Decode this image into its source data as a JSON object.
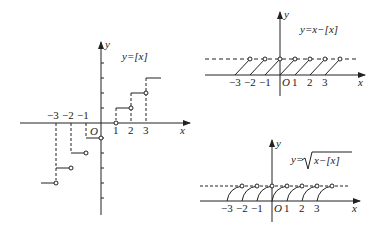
{
  "diagrams": [
    {
      "id": "floor",
      "formula": "y=[x]",
      "x_label": "x",
      "y_label": "y",
      "origin_label": "O",
      "x_ticks_positive": [
        "1",
        "2",
        "3"
      ],
      "x_ticks_negative": [
        "−3",
        "−2",
        "−1"
      ]
    },
    {
      "id": "fractional",
      "formula": "y=x−[x]",
      "x_label": "x",
      "y_label": "y",
      "origin_label": "O",
      "x_ticks": [
        "−3",
        "−2",
        "−1",
        "1",
        "2",
        "3"
      ]
    },
    {
      "id": "sqrt-fractional",
      "formula_prefix": "y=",
      "formula_radicand": "x−[x]",
      "x_label": "x",
      "y_label": "y",
      "origin_label": "O",
      "x_ticks": [
        "−3",
        "−2",
        "−1",
        "1",
        "2",
        "3"
      ]
    }
  ],
  "colors": {
    "ink": "#222222",
    "background": "#ffffff"
  }
}
